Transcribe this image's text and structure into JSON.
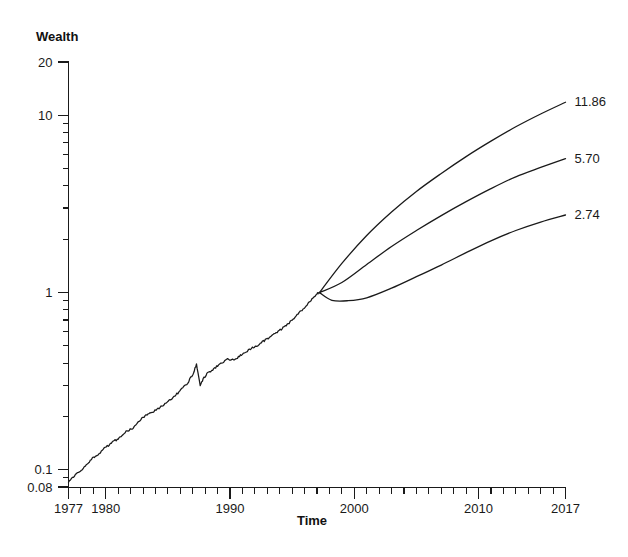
{
  "chart_data": {
    "type": "line",
    "title": "",
    "xlabel": "Time",
    "ylabel": "Wealth",
    "yscale": "log",
    "ylim": [
      0.08,
      20
    ],
    "xlim": [
      1977,
      2017
    ],
    "grid": false,
    "legend": "none",
    "y_tick_labels": [
      "20",
      "10",
      "1",
      "0.1",
      "0.08"
    ],
    "y_tick_values": [
      20,
      10,
      1,
      0.1,
      0.08
    ],
    "x_tick_labels": [
      "1977",
      "1980",
      "1990",
      "2000",
      "2010",
      "2017"
    ],
    "x_tick_values": [
      1977,
      1980,
      1990,
      2000,
      2010,
      2017
    ],
    "annotations": [
      {
        "text": "11.86",
        "value": 11.86,
        "x": 2017
      },
      {
        "text": "5.70",
        "value": 5.7,
        "x": 2017
      },
      {
        "text": "2.74",
        "value": 2.74,
        "x": 2017
      }
    ],
    "series": [
      {
        "name": "historical",
        "kind": "historical",
        "x": [
          1977.0,
          1977.4,
          1977.8,
          1978.2,
          1978.6,
          1979.0,
          1979.4,
          1979.8,
          1980.2,
          1980.6,
          1981.0,
          1981.4,
          1981.8,
          1982.2,
          1982.6,
          1983.0,
          1983.4,
          1983.8,
          1984.2,
          1984.6,
          1985.0,
          1985.4,
          1985.8,
          1986.2,
          1986.6,
          1987.0,
          1987.3,
          1987.6,
          1987.9,
          1988.2,
          1988.6,
          1989.0,
          1989.4,
          1989.8,
          1990.2,
          1990.6,
          1991.0,
          1991.4,
          1991.8,
          1992.2,
          1992.6,
          1993.0,
          1993.4,
          1993.8,
          1994.2,
          1994.6,
          1995.0,
          1995.4,
          1995.8,
          1996.2,
          1996.6,
          1997.0,
          1997.2
        ],
        "y": [
          0.085,
          0.091,
          0.097,
          0.102,
          0.11,
          0.118,
          0.122,
          0.131,
          0.137,
          0.145,
          0.149,
          0.16,
          0.167,
          0.172,
          0.186,
          0.198,
          0.206,
          0.213,
          0.221,
          0.232,
          0.242,
          0.255,
          0.271,
          0.29,
          0.31,
          0.345,
          0.395,
          0.3,
          0.33,
          0.352,
          0.366,
          0.388,
          0.402,
          0.42,
          0.417,
          0.43,
          0.452,
          0.47,
          0.489,
          0.505,
          0.526,
          0.55,
          0.575,
          0.6,
          0.628,
          0.66,
          0.7,
          0.752,
          0.8,
          0.855,
          0.915,
          0.985,
          1.0
        ]
      },
      {
        "name": "projection-high",
        "kind": "projection",
        "end_value": 11.86,
        "x": [
          1997.2,
          1999.0,
          2001.0,
          2003.0,
          2005.0,
          2007.0,
          2009.0,
          2011.0,
          2013.0,
          2015.0,
          2017.0
        ],
        "y": [
          1.0,
          1.46,
          2.1,
          2.85,
          3.72,
          4.7,
          5.85,
          7.15,
          8.62,
          10.18,
          11.86
        ]
      },
      {
        "name": "projection-mid",
        "kind": "projection",
        "end_value": 5.7,
        "x": [
          1997.2,
          1999.0,
          2001.0,
          2003.0,
          2005.0,
          2007.0,
          2009.0,
          2011.0,
          2013.0,
          2015.0,
          2017.0
        ],
        "y": [
          1.0,
          1.14,
          1.44,
          1.82,
          2.24,
          2.72,
          3.26,
          3.86,
          4.5,
          5.08,
          5.7
        ]
      },
      {
        "name": "projection-low",
        "kind": "projection",
        "end_value": 2.74,
        "x": [
          1997.2,
          1998.2,
          1999.5,
          2001.0,
          2003.0,
          2005.0,
          2007.0,
          2009.0,
          2011.0,
          2013.0,
          2015.0,
          2017.0
        ],
        "y": [
          1.0,
          0.905,
          0.9,
          0.935,
          1.06,
          1.23,
          1.43,
          1.68,
          1.96,
          2.24,
          2.5,
          2.74
        ]
      }
    ]
  },
  "labels": {
    "y_axis_title": "Wealth",
    "x_axis_title": "Time",
    "y_20": "20",
    "y_10": "10",
    "y_1": "1",
    "y_01": "0.1",
    "y_008": "0.08",
    "x_1977": "1977",
    "x_1980": "1980",
    "x_1990": "1990",
    "x_2000": "2000",
    "x_2010": "2010",
    "x_2017": "2017",
    "end_high": "11.86",
    "end_mid": "5.70",
    "end_low": "2.74"
  },
  "colors": {
    "background": "#ffffff",
    "ink": "#1a1a1a"
  }
}
